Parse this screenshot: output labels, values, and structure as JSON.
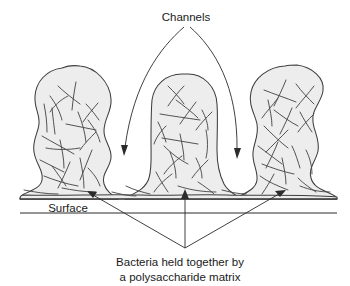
{
  "figure": {
    "title_alt": "Biofilm cross-section diagram",
    "background_color": "#ffffff",
    "matrix_fill_color": "#ededed",
    "outline_color": "#3d3d3d",
    "line_color": "#2b2b2b",
    "text_color": "#1a1a1a"
  },
  "labels": {
    "channels": "Channels",
    "surface": "Surface",
    "caption_line1": "Bacteria held together by",
    "caption_line2": "a polysaccharide matrix"
  },
  "annotations": [
    {
      "name": "channels",
      "text": "Channels",
      "text_x": 186,
      "text_y": 17,
      "arrow_targets": [
        {
          "x": 124,
          "y": 153
        },
        {
          "x": 237,
          "y": 156
        }
      ]
    },
    {
      "name": "surface",
      "text": "Surface",
      "text_x": 68,
      "text_y": 208,
      "arrow_targets": []
    },
    {
      "name": "bacteria-matrix",
      "text": "Bacteria held together by a polysaccharide matrix",
      "text_x": 180,
      "text_y": 262,
      "arrow_targets": [
        {
          "x": 90,
          "y": 191
        },
        {
          "x": 185,
          "y": 190
        },
        {
          "x": 283,
          "y": 190
        }
      ]
    }
  ],
  "surface": {
    "upper_line": {
      "x1": 20,
      "y1": 199,
      "x2": 337,
      "y2": 199
    },
    "lower_line": {
      "x1": 20,
      "y1": 213,
      "x2": 337,
      "y2": 213
    }
  },
  "colonies": [
    {
      "name": "colony-left",
      "x_range": [
        33,
        112
      ],
      "y_range": [
        68,
        200
      ]
    },
    {
      "name": "colony-middle",
      "x_range": [
        148,
        218
      ],
      "y_range": [
        74,
        200
      ]
    },
    {
      "name": "colony-right",
      "x_range": [
        248,
        332
      ],
      "y_range": [
        66,
        200
      ]
    }
  ],
  "channels": [
    {
      "name": "channel-left",
      "between": [
        "colony-left",
        "colony-middle"
      ]
    },
    {
      "name": "channel-right",
      "between": [
        "colony-middle",
        "colony-right"
      ]
    }
  ]
}
